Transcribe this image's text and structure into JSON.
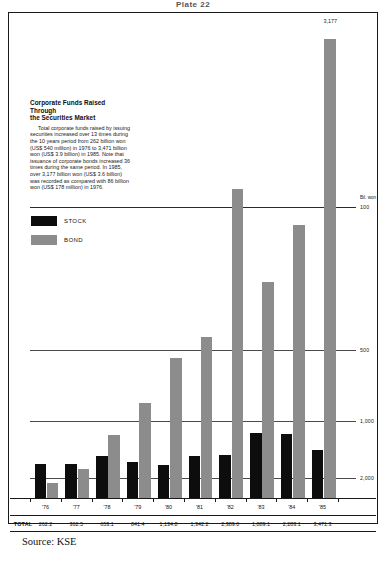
{
  "plate": {
    "title": "Plate 22"
  },
  "story": {
    "heading_line1": "Corporate Funds Raised Through",
    "heading_line2": "the Securities Market",
    "body": "Total corporate funds raised by issuing securities increased over 13 times during the 10 years period from 262 billion won (US$ 540 million) in 1976 to 3,471 billion won (US$ 3.9 billion) in 1985. Note that issuance of corporate bonds increased 36 times during the same period. In 1985, over 3,177 billion won (US$ 3.6 billion) was recorded as compared with 86 billion won (US$ 178 million) in 1976."
  },
  "legend": {
    "stock_label": "STOCK",
    "bond_label": "BOND",
    "stock_color": "#0d0d0d",
    "bond_color": "#8c8c8c"
  },
  "axis": {
    "unit": "Bil. won",
    "ticks": [
      "2,000",
      "1,000",
      "500",
      "100"
    ]
  },
  "table": {
    "total_label": "TOTAL",
    "years": [
      "'76",
      "'77",
      "'78",
      "'79",
      "'80",
      "'81",
      "'82",
      "'83",
      "'84",
      "'85"
    ],
    "totals": [
      "262.2",
      "362.5",
      "653.1",
      "841.4",
      "1,134.8",
      "1,342.2",
      "2,389.0",
      "1,889.1",
      "2,283.1",
      "3,471.3"
    ]
  },
  "source": {
    "text": "Source: KSE"
  },
  "chart_data": {
    "type": "bar",
    "title": "Corporate Funds Raised Through the Securities Market",
    "xlabel": "",
    "ylabel": "Bil. won",
    "ylim": [
      0,
      2400
    ],
    "grid": true,
    "gridlines": [
      100,
      500,
      1000,
      2000
    ],
    "legend_position": "left-middle",
    "categories": [
      "'76",
      "'77",
      "'78",
      "'79",
      "'80",
      "'81",
      "'82",
      "'83",
      "'84",
      "'85"
    ],
    "series": [
      {
        "name": "STOCK",
        "color": "#0d0d0d",
        "values": [
          196.2,
          197.5,
          253.1,
          215.4,
          192.8,
          253.2,
          263.0,
          412.1,
          411.1,
          294.3
        ]
      },
      {
        "name": "BOND",
        "color": "#8c8c8c",
        "values": [
          66.0,
          165.0,
          400.0,
          626.0,
          942.0,
          1089.0,
          2126.0,
          1477.0,
          1872.0,
          3177.0
        ]
      }
    ],
    "totals": [
      262.2,
      362.5,
      653.1,
      841.4,
      1134.8,
      1342.2,
      2389.0,
      1889.1,
      2283.1,
      3471.3
    ],
    "annotations": [
      {
        "text": "3,177",
        "series": "BOND",
        "category": "'85",
        "note": "value label above tallest bar; bar drawn with an axis break"
      }
    ]
  }
}
